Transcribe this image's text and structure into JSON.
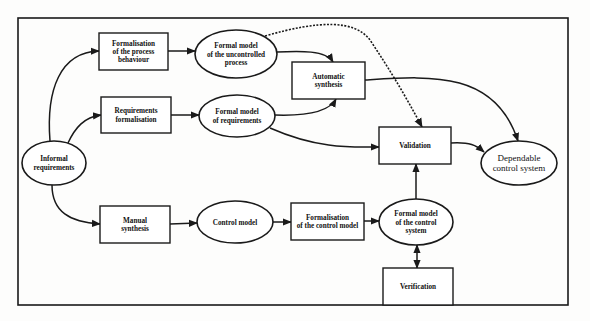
{
  "diagram": {
    "colors": {
      "stroke": "#1a1a1a",
      "background": "#fdfdfc",
      "node_fill": "#ffffff"
    },
    "frame": {
      "x": 18,
      "y": 18,
      "w": 550,
      "h": 287
    },
    "nodes": {
      "informal_requirements": {
        "shape": "ellipse",
        "lines": [
          "Informal",
          "requirements"
        ],
        "cx": 54,
        "cy": 163,
        "rx": 32,
        "ry": 22
      },
      "process_behaviour": {
        "shape": "box",
        "lines": [
          "Formalisation",
          "of the process",
          "behaviour"
        ],
        "x": 99,
        "y": 33,
        "w": 69,
        "h": 37
      },
      "requirements_formalisation": {
        "shape": "box",
        "lines": [
          "Requirements",
          "formalisation"
        ],
        "x": 101,
        "y": 97,
        "w": 70,
        "h": 36
      },
      "manual_synthesis": {
        "shape": "box",
        "lines": [
          "Manual",
          "synthesis"
        ],
        "x": 100,
        "y": 206,
        "w": 70,
        "h": 37
      },
      "model_uncontrolled_process": {
        "shape": "ellipse",
        "lines": [
          "Formal model",
          "of the uncontrolled",
          "process"
        ],
        "cx": 236,
        "cy": 54,
        "rx": 41,
        "ry": 24
      },
      "model_requirements": {
        "shape": "ellipse",
        "lines": [
          "Formal model",
          "of requirements"
        ],
        "cx": 237,
        "cy": 116,
        "rx": 38,
        "ry": 21
      },
      "control_model": {
        "shape": "ellipse",
        "lines": [
          "Control model"
        ],
        "cx": 235,
        "cy": 222,
        "rx": 38,
        "ry": 21
      },
      "automatic_synthesis": {
        "shape": "box",
        "lines": [
          "Automatic",
          "synthesis"
        ],
        "x": 292,
        "y": 62,
        "w": 73,
        "h": 37
      },
      "formalisation_control_model": {
        "shape": "box",
        "lines": [
          "Formalisation",
          "of the control model"
        ],
        "x": 291,
        "y": 203,
        "w": 73,
        "h": 37
      },
      "model_control_system": {
        "shape": "ellipse",
        "lines": [
          "Formal model",
          "of the control",
          "system"
        ],
        "cx": 416,
        "cy": 222,
        "rx": 37,
        "ry": 23
      },
      "validation": {
        "shape": "box",
        "lines": [
          "Validation"
        ],
        "x": 379,
        "y": 127,
        "w": 72,
        "h": 37
      },
      "verification": {
        "shape": "box",
        "lines": [
          "Verification"
        ],
        "x": 383,
        "y": 268,
        "w": 70,
        "h": 37
      },
      "dependable_control_system": {
        "shape": "ellipse",
        "lines": [
          "Dependable",
          "control system"
        ],
        "cx": 519,
        "cy": 163,
        "rx": 38,
        "ry": 22
      }
    },
    "edges": [
      {
        "from": "informal_requirements",
        "to": "process_behaviour",
        "style": "solid",
        "d": "M50,141 C46,90 60,52 99,51"
      },
      {
        "from": "informal_requirements",
        "to": "requirements_formalisation",
        "style": "solid",
        "d": "M68,143 C75,128 84,117 101,115"
      },
      {
        "from": "informal_requirements",
        "to": "manual_synthesis",
        "style": "solid",
        "d": "M52,185 C52,212 70,222 100,224"
      },
      {
        "from": "process_behaviour",
        "to": "model_uncontrolled_process",
        "style": "solid",
        "d": "M168,51 L195,51"
      },
      {
        "from": "requirements_formalisation",
        "to": "model_requirements",
        "style": "solid",
        "d": "M171,115 L199,115"
      },
      {
        "from": "manual_synthesis",
        "to": "control_model",
        "style": "solid",
        "d": "M170,224 L197,223"
      },
      {
        "from": "model_uncontrolled_process",
        "to": "automatic_synthesis",
        "style": "solid",
        "d": "M277,52 C300,51 326,50 333,62"
      },
      {
        "from": "model_requirements",
        "to": "automatic_synthesis",
        "style": "solid",
        "d": "M275,115 C305,116 329,112 336,99"
      },
      {
        "from": "model_uncontrolled_process",
        "to": "validation",
        "style": "dashed",
        "d": "M265,36 C320,20 355,20 370,40 C390,70 405,95 422,127"
      },
      {
        "from": "model_requirements",
        "to": "validation",
        "style": "solid",
        "d": "M270,128 C320,150 355,147 379,147"
      },
      {
        "from": "automatic_synthesis",
        "to": "dependable_control_system",
        "style": "solid",
        "d": "M365,80 C430,76 495,70 518,141"
      },
      {
        "from": "control_model",
        "to": "formalisation_control_model",
        "style": "solid",
        "d": "M273,222 L291,222"
      },
      {
        "from": "formalisation_control_model",
        "to": "model_control_system",
        "style": "solid",
        "d": "M364,221 L379,221"
      },
      {
        "from": "model_control_system",
        "to": "validation",
        "style": "solid",
        "d": "M416,199 L416,164"
      },
      {
        "from": "validation",
        "to": "dependable_control_system",
        "style": "solid",
        "d": "M451,143 C470,142 476,145 484,152"
      },
      {
        "from": "model_control_system",
        "to": "verification",
        "style": "bidirectional",
        "d": "M417,245 L417,268"
      }
    ]
  }
}
